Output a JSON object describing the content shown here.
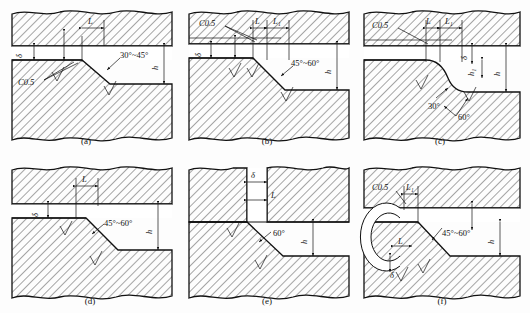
{
  "figure": {
    "type": "engineering-cross-section-set",
    "background": "#fdfdfd",
    "line_color": "#111111",
    "panel_count": 6
  },
  "panels": [
    {
      "id": "a",
      "caption": "(a)",
      "labels": {
        "length": "L",
        "thickness": "δ",
        "chamfer": "C0.5",
        "angle": "30°~45°",
        "height": "h"
      },
      "annotations": [
        "L",
        "δ",
        "C0.5",
        "30°~45°",
        "h"
      ],
      "surface_marks": 2
    },
    {
      "id": "b",
      "caption": "(b)",
      "labels": {
        "chamfer": "C0.5",
        "length": "L",
        "length1": "L₁",
        "thickness": "δ",
        "angle": "45°~60°",
        "height": "h"
      },
      "annotations": [
        "C0.5",
        "L",
        "L₁",
        "δ",
        "45°~60°",
        "h"
      ],
      "surface_marks": 3
    },
    {
      "id": "c",
      "caption": "(c)",
      "labels": {
        "chamfer": "C0.5",
        "length": "L",
        "length1": "L₁",
        "thickness": "δ",
        "angle_small": "30°",
        "angle_large": "60°",
        "height1": "h₁",
        "height": "h"
      },
      "annotations": [
        "C0.5",
        "L",
        "L₁",
        "δ",
        "30°",
        "60°",
        "h₁",
        "h"
      ],
      "surface_marks": 2
    },
    {
      "id": "d",
      "caption": "(d)",
      "labels": {
        "length": "L",
        "thickness": "δ",
        "angle": "45°~60°",
        "height": "h"
      },
      "annotations": [
        "L",
        "δ",
        "45°~60°",
        "h"
      ],
      "surface_marks": 2
    },
    {
      "id": "e",
      "caption": "(e)",
      "labels": {
        "thickness": "δ",
        "length": "L",
        "angle": "60°",
        "height": "h"
      },
      "annotations": [
        "δ",
        "L",
        "60°",
        "h"
      ],
      "surface_marks": 2
    },
    {
      "id": "f",
      "caption": "(f)",
      "labels": {
        "chamfer": "C0.5",
        "length1": "L₁",
        "length": "L",
        "thickness": "δ",
        "angle": "45°~60°",
        "height": "h"
      },
      "annotations": [
        "C0.5",
        "L₁",
        "L",
        "δ",
        "45°~60°",
        "h"
      ],
      "surface_marks": 2,
      "has_bore": true
    }
  ]
}
